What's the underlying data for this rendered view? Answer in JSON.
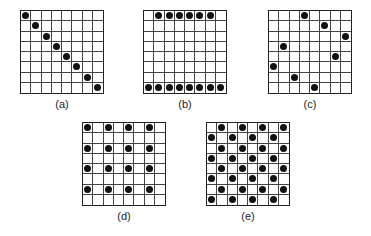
{
  "figure": {
    "grid_size": 8,
    "panels": [
      {
        "id": "a",
        "label": "(a)",
        "x": 20,
        "y": 10,
        "size": 84,
        "dots": [
          [
            0,
            0
          ],
          [
            1,
            1
          ],
          [
            2,
            2
          ],
          [
            3,
            3
          ],
          [
            4,
            4
          ],
          [
            5,
            5
          ],
          [
            6,
            6
          ],
          [
            7,
            7
          ]
        ]
      },
      {
        "id": "b",
        "label": "(b)",
        "x": 143,
        "y": 10,
        "size": 84,
        "dots": [
          [
            0,
            1
          ],
          [
            0,
            2
          ],
          [
            0,
            3
          ],
          [
            0,
            4
          ],
          [
            0,
            5
          ],
          [
            0,
            6
          ],
          [
            7,
            0
          ],
          [
            7,
            1
          ],
          [
            7,
            2
          ],
          [
            7,
            3
          ],
          [
            7,
            4
          ],
          [
            7,
            5
          ],
          [
            7,
            6
          ],
          [
            7,
            7
          ]
        ]
      },
      {
        "id": "c",
        "label": "(c)",
        "x": 268,
        "y": 10,
        "size": 84,
        "dots": [
          [
            0,
            3
          ],
          [
            1,
            5
          ],
          [
            2,
            7
          ],
          [
            3,
            1
          ],
          [
            4,
            6
          ],
          [
            5,
            0
          ],
          [
            6,
            2
          ],
          [
            7,
            4
          ]
        ]
      },
      {
        "id": "d",
        "label": "(d)",
        "x": 82,
        "y": 122,
        "size": 84,
        "dots": [
          [
            0,
            0
          ],
          [
            0,
            2
          ],
          [
            0,
            4
          ],
          [
            0,
            6
          ],
          [
            2,
            0
          ],
          [
            2,
            2
          ],
          [
            2,
            4
          ],
          [
            2,
            6
          ],
          [
            4,
            0
          ],
          [
            4,
            2
          ],
          [
            4,
            4
          ],
          [
            4,
            6
          ],
          [
            6,
            0
          ],
          [
            6,
            2
          ],
          [
            6,
            4
          ],
          [
            6,
            6
          ]
        ]
      },
      {
        "id": "e",
        "label": "(e)",
        "x": 206,
        "y": 122,
        "size": 84,
        "dots": [
          [
            0,
            1
          ],
          [
            0,
            3
          ],
          [
            0,
            5
          ],
          [
            0,
            7
          ],
          [
            1,
            0
          ],
          [
            1,
            2
          ],
          [
            1,
            4
          ],
          [
            1,
            6
          ],
          [
            2,
            1
          ],
          [
            2,
            3
          ],
          [
            2,
            5
          ],
          [
            2,
            7
          ],
          [
            3,
            0
          ],
          [
            3,
            2
          ],
          [
            3,
            4
          ],
          [
            3,
            6
          ],
          [
            4,
            1
          ],
          [
            4,
            3
          ],
          [
            4,
            5
          ],
          [
            4,
            7
          ],
          [
            5,
            0
          ],
          [
            5,
            2
          ],
          [
            5,
            4
          ],
          [
            5,
            6
          ],
          [
            6,
            1
          ],
          [
            6,
            3
          ],
          [
            6,
            5
          ],
          [
            6,
            7
          ],
          [
            7,
            0
          ],
          [
            7,
            2
          ],
          [
            7,
            4
          ],
          [
            7,
            6
          ]
        ]
      }
    ]
  }
}
